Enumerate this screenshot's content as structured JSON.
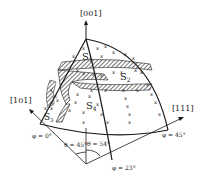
{
  "diagram": {
    "type": "stereographic-triangle",
    "poles": {
      "top": "[001]",
      "left": "[101]",
      "right": "[111]"
    },
    "regions": {
      "s1": {
        "base": "S",
        "sub": "1"
      },
      "s2": {
        "base": "S",
        "sub": "2"
      },
      "s3": {
        "base": "S",
        "sub": "3"
      },
      "s4": {
        "base": "S",
        "sub": "4"
      }
    },
    "angles": {
      "phi0": "φ = 0°",
      "phi45": "φ = 45°",
      "phi23": "φ = 23°",
      "theta45": "θ = 45°",
      "theta54": "θ = 54°"
    },
    "marker_symbol": "x",
    "colors": {
      "ink": "#1a1a1a",
      "background": "#ffffff"
    }
  }
}
